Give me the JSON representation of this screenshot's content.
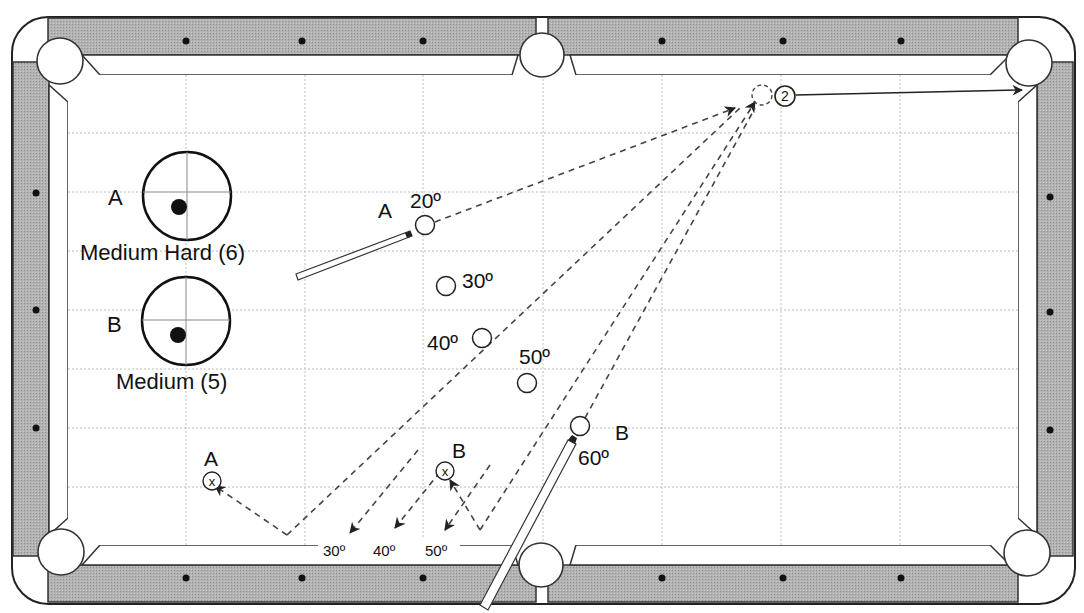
{
  "diagram": {
    "type": "billiards-shot-diagram",
    "colors": {
      "rail": "#a9a9a9",
      "rail_edge": "#333333",
      "cloth": "#ffffff",
      "grid": "#bdbdbd",
      "line": "#222222",
      "path": "#444444"
    }
  },
  "cue_tip_diagrams": [
    {
      "letter": "A",
      "caption": "Medium Hard (6)",
      "cx": 187,
      "cy": 196,
      "r": 44,
      "dot_dx": -8,
      "dot_dy": 11
    },
    {
      "letter": "B",
      "caption": "Medium (5)",
      "cx": 186,
      "cy": 321,
      "r": 44,
      "dot_dx": -8,
      "dot_dy": 14
    }
  ],
  "object_ball": {
    "label": "2",
    "x": 785,
    "y": 96
  },
  "ghost_ball": {
    "x": 762,
    "y": 95
  },
  "pocket_target": {
    "x": 1024,
    "y": 90
  },
  "cue_ball_positions": [
    {
      "angle_label": "20º",
      "x": 425,
      "y": 225,
      "label_x": 410,
      "label_y": 208
    },
    {
      "angle_label": "30º",
      "x": 446,
      "y": 286,
      "label_x": 462,
      "label_y": 288
    },
    {
      "angle_label": "40º",
      "x": 482,
      "y": 338,
      "label_x": 427,
      "label_y": 350
    },
    {
      "angle_label": "50º",
      "x": 527,
      "y": 383,
      "label_x": 519,
      "label_y": 364
    },
    {
      "angle_label": "60º",
      "x": 580,
      "y": 426,
      "label_x": 578,
      "label_y": 465
    }
  ],
  "shot_labels": [
    {
      "text": "A",
      "x": 378,
      "y": 218
    },
    {
      "text": "B",
      "x": 615,
      "y": 440
    }
  ],
  "landing_spots": [
    {
      "letter": "A",
      "x": 212,
      "y": 481,
      "label_x": 204,
      "label_y": 466
    },
    {
      "letter": "B",
      "x": 445,
      "y": 471,
      "label_x": 452,
      "label_y": 458
    }
  ],
  "rail_angle_labels": [
    {
      "text": "30º",
      "x": 323,
      "y": 556
    },
    {
      "text": "40º",
      "x": 373,
      "y": 556
    },
    {
      "text": "50º",
      "x": 425,
      "y": 556
    }
  ]
}
